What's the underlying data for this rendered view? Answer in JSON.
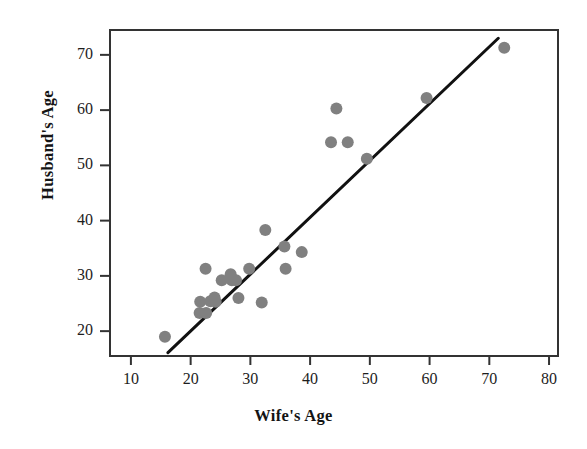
{
  "chart_data": {
    "type": "scatter",
    "title": "",
    "xlabel": "Wife's Age",
    "ylabel": "Husband's Age",
    "xlim": [
      6.5,
      81.5
    ],
    "ylim": [
      15.5,
      74.5
    ],
    "xticks": [
      10,
      20,
      30,
      40,
      50,
      60,
      70,
      80
    ],
    "yticks": [
      20,
      30,
      40,
      50,
      60,
      70
    ],
    "xtick_labels": [
      "10",
      "20",
      "30",
      "40",
      "50",
      "60",
      "70",
      "80"
    ],
    "ytick_labels": [
      "20",
      "30",
      "40",
      "50",
      "60",
      "70"
    ],
    "grid": false,
    "legend": null,
    "point_color": "#808080",
    "point_radius": 6,
    "line_color": "#111111",
    "line_width": 3,
    "frame_color": "#333333",
    "points": [
      {
        "x": 15.7,
        "y": 19.0
      },
      {
        "x": 21.5,
        "y": 23.3
      },
      {
        "x": 22.6,
        "y": 23.3
      },
      {
        "x": 21.6,
        "y": 25.3
      },
      {
        "x": 23.3,
        "y": 25.4
      },
      {
        "x": 24.2,
        "y": 25.3
      },
      {
        "x": 24.0,
        "y": 26.1
      },
      {
        "x": 22.5,
        "y": 31.3
      },
      {
        "x": 25.2,
        "y": 29.2
      },
      {
        "x": 26.7,
        "y": 30.3
      },
      {
        "x": 26.9,
        "y": 29.2
      },
      {
        "x": 27.6,
        "y": 29.2
      },
      {
        "x": 28.0,
        "y": 26.0
      },
      {
        "x": 29.8,
        "y": 31.3
      },
      {
        "x": 31.9,
        "y": 25.2
      },
      {
        "x": 32.5,
        "y": 38.3
      },
      {
        "x": 35.7,
        "y": 35.3
      },
      {
        "x": 35.9,
        "y": 31.3
      },
      {
        "x": 38.6,
        "y": 34.3
      },
      {
        "x": 43.5,
        "y": 54.2
      },
      {
        "x": 44.4,
        "y": 60.3
      },
      {
        "x": 46.3,
        "y": 54.2
      },
      {
        "x": 49.5,
        "y": 51.2
      },
      {
        "x": 59.5,
        "y": 62.2
      },
      {
        "x": 72.5,
        "y": 71.3
      }
    ],
    "fit_line": {
      "x_start": 16.2,
      "y_start": 16.1,
      "x_end": 71.5,
      "y_end": 73.0
    }
  }
}
